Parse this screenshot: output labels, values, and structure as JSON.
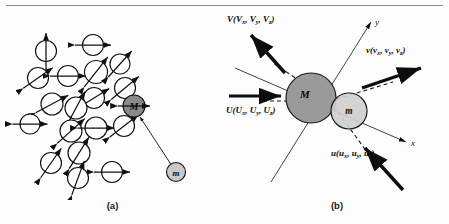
{
  "figure": {
    "panels": [
      {
        "caption": "(a)",
        "description": "spin-cluster-with-magnetic-moments",
        "particles": [
          {
            "label": "M",
            "role": "heavy-particle",
            "fill": "#8a8a8a"
          },
          {
            "label": "m",
            "role": "light-particle",
            "fill": "#c9c9c9"
          }
        ],
        "spin_sites": [
          {
            "cx": 46,
            "cy": 51,
            "r": 10.5,
            "angle": 90
          },
          {
            "cx": 93,
            "cy": 45,
            "r": 10.5,
            "angle": 0
          },
          {
            "cx": 38,
            "cy": 78,
            "r": 10.5,
            "angle": 35
          },
          {
            "cx": 68,
            "cy": 76,
            "r": 10.5,
            "angle": 0
          },
          {
            "cx": 96,
            "cy": 72,
            "r": 11.5,
            "angle": 52
          },
          {
            "cx": 120,
            "cy": 64,
            "r": 10.0,
            "angle": 48
          },
          {
            "cx": 125,
            "cy": 88,
            "r": 10.5,
            "angle": 40
          },
          {
            "cx": 94,
            "cy": 98,
            "r": 10.5,
            "angle": 32
          },
          {
            "cx": 52,
            "cy": 104,
            "r": 11.0,
            "angle": 28
          },
          {
            "cx": 76,
            "cy": 108,
            "r": 11.0,
            "angle": 62
          },
          {
            "cx": 30,
            "cy": 124,
            "r": 10.0,
            "angle": 0
          },
          {
            "cx": 71,
            "cy": 131,
            "r": 11.0,
            "angle": 42
          },
          {
            "cx": 96,
            "cy": 128,
            "r": 11.0,
            "angle": 0
          },
          {
            "cx": 124,
            "cy": 126,
            "r": 10.5,
            "angle": 38
          },
          {
            "cx": 79,
            "cy": 153,
            "r": 11.0,
            "angle": 58
          },
          {
            "cx": 51,
            "cy": 163,
            "r": 10.5,
            "angle": 55
          },
          {
            "cx": 78,
            "cy": 178,
            "r": 10.5,
            "angle": 70
          },
          {
            "cx": 112,
            "cy": 172,
            "r": 10.5,
            "angle": 0
          }
        ]
      },
      {
        "caption": "(b)",
        "description": "binary-collision-velocity-vectors",
        "particles": [
          {
            "label": "M",
            "role": "heavy-particle",
            "fill": "#9a9a9a"
          },
          {
            "label": "m",
            "role": "light-particle",
            "fill": "#cfcfcf"
          }
        ],
        "axes": [
          {
            "name": "y",
            "label": "y"
          },
          {
            "name": "x",
            "label": "x"
          }
        ],
        "vectors": [
          {
            "name": "V",
            "symbol": "V",
            "components": [
              "V",
              "V",
              "V"
            ],
            "subs": [
              "x",
              "y",
              "z"
            ],
            "text": "V(Vx, Vy, Vz)",
            "role": "heavy-particle-post-collision-velocity"
          },
          {
            "name": "U",
            "symbol": "U",
            "components": [
              "U",
              "U",
              "U"
            ],
            "subs": [
              "x",
              "y",
              "z"
            ],
            "text": "U(Ux, Uy, Uz)",
            "role": "heavy-particle-pre-collision-velocity"
          },
          {
            "name": "v",
            "symbol": "v",
            "components": [
              "v",
              "v",
              "v"
            ],
            "subs": [
              "x",
              "y",
              "z"
            ],
            "text": "v(vx, vy, vz)",
            "role": "light-particle-post-collision-velocity"
          },
          {
            "name": "u",
            "symbol": "u",
            "components": [
              "u",
              "u",
              "u"
            ],
            "subs": [
              "x",
              "y",
              "z"
            ],
            "text": "u(ux, uy, uz)",
            "role": "light-particle-pre-collision-velocity"
          }
        ]
      }
    ]
  }
}
